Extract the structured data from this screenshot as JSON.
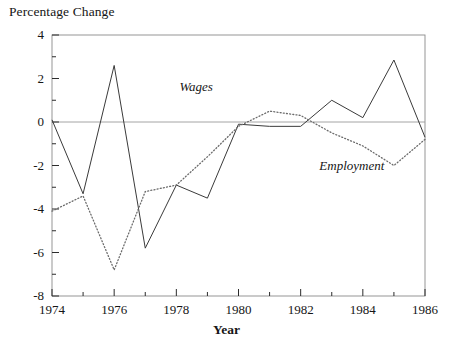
{
  "chart_data": {
    "type": "line",
    "title": "",
    "ylabel": "Percentage Change",
    "xlabel": "Year",
    "x": [
      1974,
      1975,
      1976,
      1977,
      1978,
      1979,
      1980,
      1981,
      1982,
      1983,
      1984,
      1985,
      1986
    ],
    "xlim": [
      1974,
      1986
    ],
    "ylim": [
      -8,
      4
    ],
    "xticks": [
      1974,
      1976,
      1978,
      1980,
      1982,
      1984,
      1986
    ],
    "xtick_labels": [
      "1974",
      "1976",
      "1978",
      "1980",
      "1982",
      "1984",
      "1986"
    ],
    "xminor_ticks": [
      1975,
      1977,
      1979,
      1981,
      1983,
      1985
    ],
    "yticks": [
      4,
      2,
      0,
      -2,
      -4,
      -6,
      -8
    ],
    "ytick_labels": [
      "4",
      "2",
      "0",
      "-2",
      "-4",
      "-6",
      "-8"
    ],
    "yminor_ticks": [
      3,
      1,
      -1,
      -3,
      -5,
      -7
    ],
    "grid": false,
    "zero_line": true,
    "legend_position": "inline-annotations",
    "series": [
      {
        "name": "Wages",
        "style": "solid",
        "color": "#3a3a3a",
        "values": [
          0.1,
          -3.3,
          2.6,
          -5.8,
          -2.9,
          -3.5,
          -0.1,
          -0.2,
          -0.2,
          1.0,
          0.2,
          2.85,
          -0.7
        ]
      },
      {
        "name": "Employment",
        "style": "dotted",
        "color": "#6b6b6b",
        "values": [
          -4.1,
          -3.4,
          -6.8,
          -3.2,
          -2.9,
          -1.6,
          -0.2,
          0.5,
          0.3,
          -0.5,
          -1.1,
          -2.0,
          -0.8
        ]
      }
    ],
    "annotations": [
      {
        "text": "Wages",
        "x": 1978.1,
        "y": 1.55
      },
      {
        "text": "Employment",
        "x": 1982.6,
        "y": -2.05
      }
    ]
  }
}
